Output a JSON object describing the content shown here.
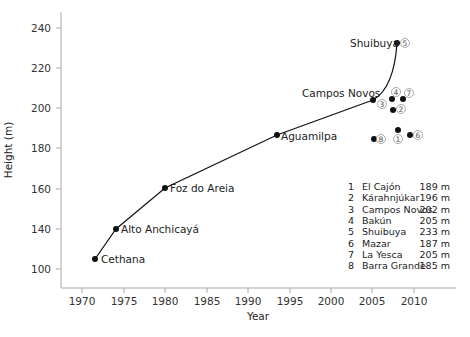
{
  "chart_data": {
    "type": "line",
    "title": "",
    "xlabel": "Year",
    "ylabel": "Height (m)",
    "xlim": [
      1967,
      2015
    ],
    "x_ticks": [
      1970,
      1975,
      1980,
      1985,
      1990,
      1995,
      2000,
      2005,
      2010
    ],
    "y_ticks": [
      100,
      140,
      160,
      180,
      200,
      220,
      240
    ],
    "grid": false,
    "series": [
      {
        "name": "Record CFRD heights",
        "type": "line",
        "points": [
          {
            "label": "Cethana",
            "x": 1971.5,
            "y": 110
          },
          {
            "label": "Alto Anchicayá",
            "x": 1974,
            "y": 140
          },
          {
            "label": "Foz do Areia",
            "x": 1980,
            "y": 160
          },
          {
            "label": "Aguamilpa",
            "x": 1993.5,
            "y": 187
          },
          {
            "label": "Campos Novos",
            "x": 2005,
            "y": 202
          },
          {
            "label": "Shuibuya",
            "x": 2008,
            "y": 233
          }
        ]
      },
      {
        "name": "Recent dams",
        "type": "scatter",
        "points": [
          {
            "id": "1",
            "label": "El Cajón",
            "x": 2007.4,
            "y": 189
          },
          {
            "id": "2",
            "label": "Kárahnjúkar",
            "x": 2007.2,
            "y": 196
          },
          {
            "id": "3",
            "label": "Campos Novos",
            "x": 2005,
            "y": 202
          },
          {
            "id": "4",
            "label": "Bakún",
            "x": 2007.1,
            "y": 205
          },
          {
            "id": "5",
            "label": "Shuibuya",
            "x": 2008,
            "y": 233
          },
          {
            "id": "6",
            "label": "Mazar",
            "x": 2009,
            "y": 187
          },
          {
            "id": "7",
            "label": "La Yesca",
            "x": 2008.2,
            "y": 205
          },
          {
            "id": "8",
            "label": "Barra Grande",
            "x": 2005.2,
            "y": 185
          }
        ]
      }
    ],
    "legend": {
      "position": "lower right",
      "entries": [
        {
          "num": "1",
          "name": "El Cajón",
          "height": "189 m"
        },
        {
          "num": "2",
          "name": "Kárahnjúkar",
          "height": "196 m"
        },
        {
          "num": "3",
          "name": "Campos Novos",
          "height": "202 m"
        },
        {
          "num": "4",
          "name": "Bakún",
          "height": "205 m"
        },
        {
          "num": "5",
          "name": "Shuibuya",
          "height": "233 m"
        },
        {
          "num": "6",
          "name": "Mazar",
          "height": "187 m"
        },
        {
          "num": "7",
          "name": "La Yesca",
          "height": "205 m"
        },
        {
          "num": "8",
          "name": "Barra Grande",
          "height": "185 m"
        }
      ]
    }
  },
  "render": {
    "main_points_px": [
      {
        "label": "Cethana",
        "cx": 95,
        "cy": 259,
        "lx": 101,
        "ly": 263
      },
      {
        "label": "Alto Anchicayá",
        "cx": 116,
        "cy": 229,
        "lx": 121,
        "ly": 233
      },
      {
        "label": "Foz do Areia",
        "cx": 165,
        "cy": 188,
        "lx": 170,
        "ly": 192
      },
      {
        "label": "Aguamilpa",
        "cx": 277,
        "cy": 135,
        "lx": 281,
        "ly": 140
      },
      {
        "label": "Campos Novos",
        "cx": 373,
        "cy": 100,
        "lx": 302,
        "ly": 97,
        "anchor": "start"
      },
      {
        "label": "Shuibuya",
        "cx": 397,
        "cy": 43,
        "lx": 350,
        "ly": 47,
        "anchor": "start"
      }
    ],
    "numbered_px": [
      {
        "id": "3",
        "cx": 373,
        "cy": 100,
        "nx": 382,
        "ny": 104,
        "dot": false
      },
      {
        "id": "5",
        "cx": 397,
        "cy": 43,
        "nx": 405,
        "ny": 43,
        "dot": false
      },
      {
        "id": "4",
        "cx": 392,
        "cy": 99,
        "nx": 396,
        "ny": 92,
        "dot": true
      },
      {
        "id": "7",
        "cx": 403,
        "cy": 99,
        "nx": 409,
        "ny": 93,
        "dot": true
      },
      {
        "id": "2",
        "cx": 393,
        "cy": 110,
        "nx": 401,
        "ny": 109,
        "dot": true
      },
      {
        "id": "1",
        "cx": 398,
        "cy": 130,
        "nx": 398,
        "ny": 139,
        "dot": true
      },
      {
        "id": "6",
        "cx": 410,
        "cy": 135,
        "nx": 418,
        "ny": 135,
        "dot": true
      },
      {
        "id": "8",
        "cx": 374,
        "cy": 139,
        "nx": 381,
        "ny": 139,
        "dot": true
      }
    ],
    "y_tick_px": [
      269,
      229,
      189,
      148,
      108,
      68,
      28
    ],
    "x_tick_px": [
      82,
      124,
      165,
      207,
      248,
      290,
      331,
      372,
      414
    ]
  }
}
